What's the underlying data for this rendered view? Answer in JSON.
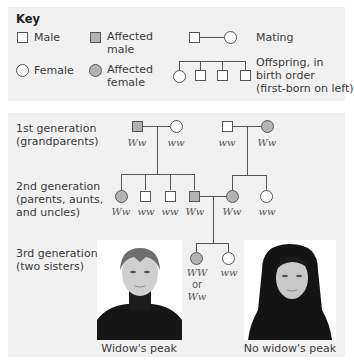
{
  "key": {
    "title": "Key",
    "items": [
      {
        "label": "Male",
        "symbol": "square",
        "affected": false
      },
      {
        "label_line1": "Affected",
        "label_line2": "male",
        "symbol": "square",
        "affected": true
      },
      {
        "label": "Mating",
        "symbol": "square-line-circle"
      },
      {
        "label": "Female",
        "symbol": "circle",
        "affected": false
      },
      {
        "label_line1": "Affected",
        "label_line2": "female",
        "symbol": "circle",
        "affected": true
      },
      {
        "label_line1": "Offspring, in",
        "label_line2": "birth order",
        "label_line3": "(first-born on left)",
        "symbol": "sibship"
      }
    ]
  },
  "generations": [
    {
      "line1": "1st generation",
      "line2": "(grandparents)"
    },
    {
      "line1": "2nd generation",
      "line2": "(parents, aunts,",
      "line3": "and uncles)"
    },
    {
      "line1": "3rd generation",
      "line2": "(two sisters)"
    }
  ],
  "pedigree": {
    "gen1": [
      {
        "sex": "male",
        "affected": true,
        "genotype": "Ww"
      },
      {
        "sex": "female",
        "affected": false,
        "genotype": "ww"
      },
      {
        "sex": "male",
        "affected": false,
        "genotype": "ww"
      },
      {
        "sex": "female",
        "affected": true,
        "genotype": "Ww"
      }
    ],
    "gen2": [
      {
        "sex": "female",
        "affected": true,
        "genotype": "Ww"
      },
      {
        "sex": "male",
        "affected": false,
        "genotype": "ww"
      },
      {
        "sex": "male",
        "affected": false,
        "genotype": "ww"
      },
      {
        "sex": "male",
        "affected": true,
        "genotype": "Ww"
      },
      {
        "sex": "female",
        "affected": true,
        "genotype": "Ww"
      },
      {
        "sex": "female",
        "affected": false,
        "genotype": "ww"
      }
    ],
    "gen3": [
      {
        "sex": "female",
        "affected": true,
        "genotype_line1": "WW",
        "genotype_line2": "or",
        "genotype_line3": "Ww"
      },
      {
        "sex": "female",
        "affected": false,
        "genotype": "ww"
      }
    ]
  },
  "photos": [
    {
      "caption": "Widow's peak",
      "subject": "woman-with-widows-peak"
    },
    {
      "caption": "No widow's peak",
      "subject": "woman-without-widows-peak"
    }
  ],
  "colors": {
    "affected_fill": "#b3b3b3",
    "panel_bg": "#f1f1f1",
    "line": "#555555"
  }
}
